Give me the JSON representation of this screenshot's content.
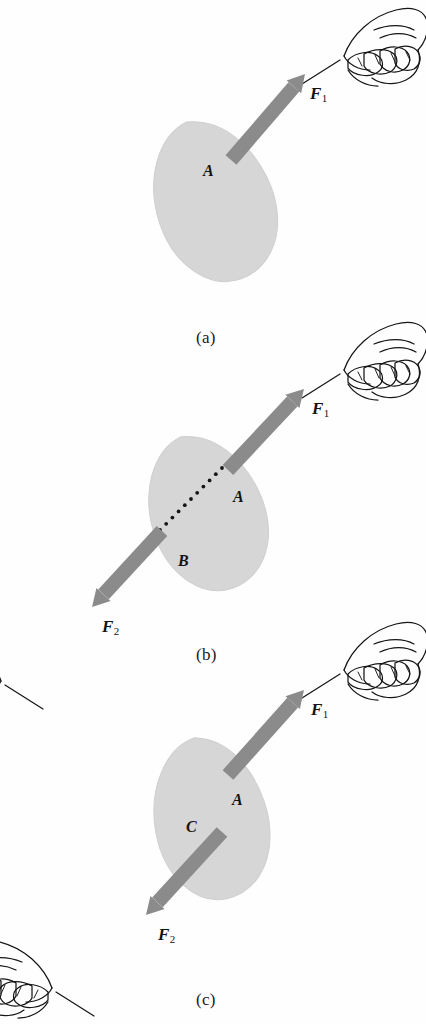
{
  "figure": {
    "background_color": "#fefefe",
    "blob_color": "#d6d6d6",
    "blob_edge_color": "#cfcfcf",
    "arrow_color": "#8b8b8b",
    "ink_color": "#151515"
  },
  "panels": [
    {
      "id": "a",
      "caption": "(a)",
      "caption_x": 196,
      "caption_y": 328,
      "blob": {
        "cx": 215,
        "cy": 200,
        "rx": 60,
        "ry": 83,
        "rotate": -20
      },
      "points": [
        {
          "name": "A",
          "label": "A",
          "x": 203,
          "y": 162
        }
      ],
      "forces": [
        {
          "name": "F1",
          "label": "F",
          "subscript": "1",
          "label_x": 310,
          "label_y": 84,
          "tail_x": 231,
          "tail_y": 160,
          "head_x": 305,
          "head_y": 74
        }
      ],
      "hands": [
        {
          "name": "hand-upper-right",
          "x": 318,
          "y": 8,
          "flip": false
        }
      ]
    },
    {
      "id": "b",
      "caption": "(b)",
      "caption_x": 196,
      "caption_y": 645,
      "blob": {
        "cx": 208,
        "cy": 512,
        "rx": 58,
        "ry": 80,
        "rotate": -20
      },
      "points": [
        {
          "name": "A",
          "label": "A",
          "x": 233,
          "y": 488
        },
        {
          "name": "B",
          "label": "B",
          "x": 178,
          "y": 552
        }
      ],
      "dotted_line": {
        "x1": 160,
        "y1": 530,
        "x2": 222,
        "y2": 468,
        "dots": 11
      },
      "forces": [
        {
          "name": "F1",
          "label": "F",
          "subscript": "1",
          "label_x": 312,
          "label_y": 399,
          "tail_x": 228,
          "tail_y": 470,
          "head_x": 304,
          "head_y": 389
        },
        {
          "name": "F2",
          "label": "F",
          "subscript": "2",
          "label_x": 102,
          "label_y": 617,
          "tail_x": 162,
          "tail_y": 531,
          "head_x": 92,
          "head_y": 607
        }
      ],
      "hands": [
        {
          "name": "hand-upper-right",
          "x": 318,
          "y": 322,
          "flip": false
        },
        {
          "name": "hand-lower-left",
          "x": 27,
          "y": 633,
          "flip": true
        }
      ]
    },
    {
      "id": "c",
      "caption": "(c)",
      "caption_x": 196,
      "caption_y": 990,
      "blob": {
        "cx": 212,
        "cy": 818,
        "rx": 58,
        "ry": 82,
        "rotate": -12
      },
      "points": [
        {
          "name": "A",
          "label": "A",
          "x": 232,
          "y": 791
        },
        {
          "name": "C",
          "label": "C",
          "x": 186,
          "y": 818
        }
      ],
      "forces": [
        {
          "name": "F1",
          "label": "F",
          "subscript": "1",
          "label_x": 311,
          "label_y": 700,
          "tail_x": 228,
          "tail_y": 775,
          "head_x": 304,
          "head_y": 690
        },
        {
          "name": "F2",
          "label": "F",
          "subscript": "2",
          "label_x": 158,
          "label_y": 925,
          "tail_x": 222,
          "tail_y": 832,
          "head_x": 146,
          "head_y": 915
        }
      ],
      "hands": [
        {
          "name": "hand-upper-right",
          "x": 318,
          "y": 622,
          "flip": false
        },
        {
          "name": "hand-lower-left",
          "x": 78,
          "y": 940,
          "flip": true
        }
      ]
    }
  ]
}
